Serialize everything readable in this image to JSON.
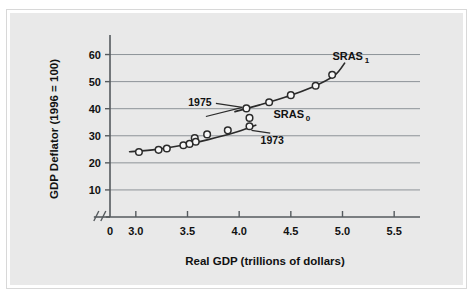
{
  "figure": {
    "panel_color": "#e9e9e9",
    "border_color": "#d8d8d8",
    "axis_color": "#555a5e",
    "grid_color": "#8d9398",
    "curve_color": "#2b2b2b",
    "marker_fill": "#f7f7f7"
  },
  "chart_data": {
    "type": "scatter",
    "title": "",
    "subtitle": "",
    "xlabel": "Real GDP (trillions of dollars)",
    "ylabel": "GDP Deflator (1996 = 100)",
    "xlim": [
      2.75,
      5.75
    ],
    "ylim": [
      0,
      65
    ],
    "grid": true,
    "grid_axis": "y",
    "legend_position": "inline-annotations",
    "axis_break": {
      "present": true,
      "symbol": "//",
      "between": [
        0,
        3.0
      ],
      "axis": "x"
    },
    "xticks": [
      0,
      3.0,
      3.5,
      4.0,
      4.5,
      5.0,
      5.5
    ],
    "xtick_labels": [
      "0",
      "3.0",
      "3.5",
      "4.0",
      "4.5",
      "5.0",
      "5.5"
    ],
    "yticks": [
      10,
      20,
      30,
      40,
      50,
      60
    ],
    "ytick_labels": [
      "10",
      "20",
      "30",
      "40",
      "50",
      "60"
    ],
    "series": [
      {
        "name": "SRAS_0",
        "label": "SRAS",
        "label_sub": "0",
        "label_x": 4.48,
        "label_y": 36.6,
        "points": [
          {
            "x": 3.03,
            "y": 24.0
          },
          {
            "x": 3.22,
            "y": 24.8
          },
          {
            "x": 3.3,
            "y": 25.3
          },
          {
            "x": 3.46,
            "y": 26.5
          },
          {
            "x": 3.52,
            "y": 27.0
          },
          {
            "x": 3.57,
            "y": 29.2
          },
          {
            "x": 3.58,
            "y": 27.8
          },
          {
            "x": 3.69,
            "y": 30.5
          },
          {
            "x": 3.89,
            "y": 32.0
          },
          {
            "x": 4.1,
            "y": 33.5
          }
        ],
        "curve": [
          {
            "x": 2.94,
            "y": 24.1
          },
          {
            "x": 3.2,
            "y": 25.0
          },
          {
            "x": 3.45,
            "y": 26.5
          },
          {
            "x": 3.7,
            "y": 28.6
          },
          {
            "x": 3.95,
            "y": 31.1
          },
          {
            "x": 4.16,
            "y": 33.9
          }
        ]
      },
      {
        "name": "SRAS_1",
        "label": "SRAS",
        "label_sub": "1",
        "label_x": 5.05,
        "label_y": 57.8,
        "points": [
          {
            "x": 4.07,
            "y": 40.1
          },
          {
            "x": 4.29,
            "y": 42.4
          },
          {
            "x": 4.5,
            "y": 45.0
          },
          {
            "x": 4.74,
            "y": 48.5
          },
          {
            "x": 4.9,
            "y": 52.5
          }
        ],
        "curve": [
          {
            "x": 3.96,
            "y": 38.9
          },
          {
            "x": 4.2,
            "y": 41.4
          },
          {
            "x": 4.45,
            "y": 44.3
          },
          {
            "x": 4.7,
            "y": 47.8
          },
          {
            "x": 4.92,
            "y": 52.2
          },
          {
            "x": 5.02,
            "y": 56.8
          }
        ]
      },
      {
        "name": "transition-point",
        "label": "",
        "label_sub": "",
        "points": [
          {
            "x": 4.1,
            "y": 36.6
          }
        ],
        "curve": []
      }
    ],
    "annotations": [
      {
        "text": "1975",
        "text_x": 3.62,
        "text_y": 42.3,
        "target_x": 4.07,
        "target_y": 40.1
      },
      {
        "text": "1973",
        "text_x": 4.32,
        "text_y": 28.4,
        "target_x": 4.1,
        "target_y": 33.5
      }
    ]
  }
}
